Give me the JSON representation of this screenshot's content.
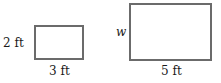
{
  "diagram": {
    "small_rectangle": {
      "height_label": "2 ft",
      "width_label": "3 ft"
    },
    "large_rectangle": {
      "height_label": "w",
      "width_label": "5 ft"
    },
    "colors": {
      "stroke": "#6b6b6b",
      "text": "#1a1a1a",
      "background": "#ffffff"
    }
  }
}
